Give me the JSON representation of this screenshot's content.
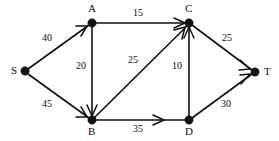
{
  "diagram": {
    "type": "directed-graph",
    "colors": {
      "background": "#ffffff",
      "stroke": "#111111",
      "node_fill": "#111111"
    },
    "nodes": [
      {
        "id": "S",
        "label": "S",
        "x": 25,
        "y": 71,
        "label_x": 11,
        "label_y": 65
      },
      {
        "id": "A",
        "label": "A",
        "x": 92,
        "y": 23,
        "label_x": 88,
        "label_y": 3
      },
      {
        "id": "B",
        "label": "B",
        "x": 92,
        "y": 120,
        "label_x": 88,
        "label_y": 126
      },
      {
        "id": "C",
        "label": "C",
        "x": 189,
        "y": 23,
        "label_x": 185,
        "label_y": 3
      },
      {
        "id": "D",
        "label": "D",
        "x": 189,
        "y": 120,
        "label_x": 185,
        "label_y": 126
      },
      {
        "id": "T",
        "label": "T",
        "x": 255,
        "y": 72,
        "label_x": 264,
        "label_y": 66
      }
    ],
    "edges": [
      {
        "id": "S-A",
        "from": "S",
        "to": "A",
        "weight": "40",
        "label_x": 42,
        "label_y": 33
      },
      {
        "id": "S-B",
        "from": "S",
        "to": "B",
        "weight": "45",
        "label_x": 42,
        "label_y": 99
      },
      {
        "id": "A-C",
        "from": "A",
        "to": "C",
        "weight": "15",
        "label_x": 133,
        "label_y": 8
      },
      {
        "id": "A-B",
        "from": "A",
        "to": "B",
        "weight": "20",
        "label_x": 76,
        "label_y": 61
      },
      {
        "id": "B-C",
        "from": "B",
        "to": "C",
        "weight": "25",
        "label_x": 128,
        "label_y": 55
      },
      {
        "id": "B-D",
        "from": "B",
        "to": "D",
        "weight": "35",
        "label_x": 133,
        "label_y": 124
      },
      {
        "id": "D-C",
        "from": "D",
        "to": "C",
        "weight": "10",
        "label_x": 172,
        "label_y": 61
      },
      {
        "id": "C-T",
        "from": "C",
        "to": "T",
        "weight": "25",
        "label_x": 222,
        "label_y": 33
      },
      {
        "id": "D-T",
        "from": "D",
        "to": "T",
        "weight": "30",
        "label_x": 221,
        "label_y": 99
      }
    ]
  }
}
